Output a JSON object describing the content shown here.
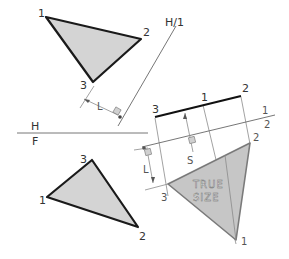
{
  "figure": {
    "fold_lines": {
      "hf": {
        "top_label": "H",
        "bottom_label": "F"
      },
      "h1": {
        "label": "H/1"
      },
      "aux12": {
        "top_label": "1",
        "bottom_label": "2"
      }
    },
    "top_view": {
      "vertices": [
        {
          "label": "1",
          "x": 46,
          "y": 17
        },
        {
          "label": "2",
          "x": 141,
          "y": 39
        },
        {
          "label": "3",
          "x": 93,
          "y": 82
        }
      ]
    },
    "front_view": {
      "vertices": [
        {
          "label": "1",
          "x": 47,
          "y": 197
        },
        {
          "label": "2",
          "x": 138,
          "y": 227
        },
        {
          "label": "3",
          "x": 92,
          "y": 160
        }
      ]
    },
    "edge_view": {
      "vertices": [
        {
          "label": "3",
          "x": 155,
          "y": 117
        },
        {
          "label": "1",
          "x": 203,
          "y": 104
        },
        {
          "label": "2",
          "x": 241,
          "y": 96
        }
      ]
    },
    "true_size_view": {
      "label_line1": "TRUE",
      "label_line2": "SIZE",
      "vertices": [
        {
          "label": "3",
          "x": 168,
          "y": 184
        },
        {
          "label": "2",
          "x": 250,
          "y": 143
        },
        {
          "label": "1",
          "x": 236,
          "y": 240
        }
      ]
    },
    "dimensions": {
      "l_top": "L",
      "l_aux": "L",
      "s_aux": "S"
    }
  }
}
